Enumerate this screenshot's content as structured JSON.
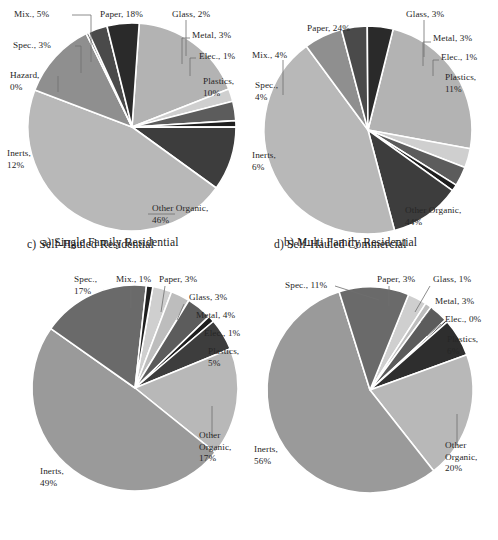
{
  "figure": {
    "background": "#ffffff",
    "panel_count": 4
  },
  "palette": {
    "paper": "#b3b3b3",
    "glass": "#cfcfcf",
    "metal": "#5c5c5c",
    "electronics": "#1f1f1f",
    "plastics": "#3d3d3d",
    "other_organic": "#b8b8b8",
    "inerts": "#8f8f8f",
    "hazardous": "#707070",
    "special": "#4a4a4a",
    "mixed": "#2a2a2a",
    "separator": "#ffffff",
    "text": "#262626",
    "leader_line": "#6f6f6f"
  },
  "panels": [
    {
      "id": "a",
      "caption": "a) Single Family Residential",
      "center": {
        "x": 132,
        "y": 127
      },
      "radius": 104,
      "start_angle_deg": -86,
      "slices": [
        {
          "key": "paper",
          "label": "Paper, 18%",
          "value": 18,
          "color": "#b3b3b3"
        },
        {
          "key": "glass",
          "label": "Glass, 2%",
          "value": 2,
          "color": "#cfcfcf"
        },
        {
          "key": "metal",
          "label": "Metal, 3%",
          "value": 3,
          "color": "#5c5c5c"
        },
        {
          "key": "electronics",
          "label": "Elec., 1%",
          "value": 1,
          "color": "#1f1f1f"
        },
        {
          "key": "plastics",
          "label": "Plastics, 10%",
          "value": 10,
          "color": "#3d3d3d"
        },
        {
          "key": "other_organic",
          "label": "Other Organic, 46%",
          "value": 46,
          "color": "#b8b8b8"
        },
        {
          "key": "inerts",
          "label": "Inerts, 12%",
          "value": 12,
          "color": "#8f8f8f"
        },
        {
          "key": "hazardous",
          "label": "Hazard, 0%",
          "value": 0.4,
          "color": "#707070"
        },
        {
          "key": "special",
          "label": "Spec., 3%",
          "value": 3,
          "color": "#4a4a4a"
        },
        {
          "key": "mixed",
          "label": "Mix., 5%",
          "value": 5,
          "color": "#2a2a2a"
        }
      ],
      "labels": [
        {
          "name": "label-mixed",
          "line1": "Mix., 5%",
          "line2": "",
          "x": 14,
          "y": 9,
          "align": "left"
        },
        {
          "name": "label-paper",
          "line1": "Paper, 18%",
          "line2": "",
          "x": 100,
          "y": 9,
          "align": "left"
        },
        {
          "name": "label-glass",
          "line1": "Glass, 2%",
          "line2": "",
          "x": 172,
          "y": 9,
          "align": "left"
        },
        {
          "name": "label-metal",
          "line1": "Metal, 3%",
          "line2": "",
          "x": 192,
          "y": 30,
          "align": "left"
        },
        {
          "name": "label-special",
          "line1": "Spec., 3%",
          "line2": "",
          "x": 13,
          "y": 40,
          "align": "left"
        },
        {
          "name": "label-electronics",
          "line1": "Elec., 1%",
          "line2": "",
          "x": 199,
          "y": 51,
          "align": "left"
        },
        {
          "name": "label-hazardous",
          "line1": "Hazard,",
          "line2": "0%",
          "x": 10,
          "y": 70,
          "align": "left"
        },
        {
          "name": "label-plastics",
          "line1": "Plastics,",
          "line2": "10%",
          "x": 203,
          "y": 76,
          "align": "left"
        },
        {
          "name": "label-inerts",
          "line1": "Inerts,",
          "line2": "12%",
          "x": 7,
          "y": 148,
          "align": "left"
        },
        {
          "name": "label-other-organic",
          "line1": "Other Organic,",
          "line2": "46%",
          "x": 152,
          "y": 203,
          "align": "left"
        }
      ],
      "leaders": [
        {
          "name": "leader-mixed",
          "points": "72,15 91,15 91,62"
        },
        {
          "name": "leader-special",
          "points": "75,46 81,46 81,73"
        },
        {
          "name": "leader-hazardous",
          "points": "58,76 58,92"
        },
        {
          "name": "leader-glass",
          "points": "186,20 186,56"
        },
        {
          "name": "leader-metal",
          "points": "190,38 182,38 182,64"
        },
        {
          "name": "leader-electronics",
          "points": "196,58 190,58 190,76"
        },
        {
          "name": "leader-other",
          "points": "148,214 175,214"
        }
      ]
    },
    {
      "id": "b",
      "caption": "b) Multi Family Residential",
      "center": {
        "x": 119,
        "y": 130
      },
      "radius": 104,
      "start_angle_deg": -76,
      "slices": [
        {
          "key": "paper",
          "label": "Paper, 24%",
          "value": 24,
          "color": "#b3b3b3"
        },
        {
          "key": "glass",
          "label": "Glass, 3%",
          "value": 3,
          "color": "#cfcfcf"
        },
        {
          "key": "metal",
          "label": "Metal, 3%",
          "value": 3,
          "color": "#5c5c5c"
        },
        {
          "key": "electronics",
          "label": "Elec., 1%",
          "value": 1,
          "color": "#1f1f1f"
        },
        {
          "key": "plastics",
          "label": "Plastics, 11%",
          "value": 11,
          "color": "#3d3d3d"
        },
        {
          "key": "other_organic",
          "label": "Other Organic, 44%",
          "value": 44,
          "color": "#b8b8b8"
        },
        {
          "key": "inerts",
          "label": "Inerts, 6%",
          "value": 6,
          "color": "#8f8f8f"
        },
        {
          "key": "special",
          "label": "Spec., 4%",
          "value": 4,
          "color": "#4a4a4a"
        },
        {
          "key": "mixed",
          "label": "Mix., 4%",
          "value": 4,
          "color": "#2a2a2a"
        }
      ],
      "labels": [
        {
          "name": "label-paper",
          "line1": "Paper, 24%",
          "line2": "",
          "x": 58,
          "y": 23,
          "align": "left"
        },
        {
          "name": "label-glass",
          "line1": "Glass, 3%",
          "line2": "",
          "x": 157,
          "y": 9,
          "align": "left"
        },
        {
          "name": "label-metal",
          "line1": "Metal, 3%",
          "line2": "",
          "x": 184,
          "y": 33,
          "align": "left"
        },
        {
          "name": "label-mixed",
          "line1": "Mix., 4%",
          "line2": "",
          "x": 3,
          "y": 50,
          "align": "left"
        },
        {
          "name": "label-electronics",
          "line1": "Elec., 1%",
          "line2": "",
          "x": 192,
          "y": 52,
          "align": "left"
        },
        {
          "name": "label-special",
          "line1": "Spec.,",
          "line2": "4%",
          "x": 6,
          "y": 80,
          "align": "left"
        },
        {
          "name": "label-plastics",
          "line1": "Plastics,",
          "line2": "11%",
          "x": 196,
          "y": 72,
          "align": "left"
        },
        {
          "name": "label-inerts",
          "line1": "Inerts,",
          "line2": "6%",
          "x": 3,
          "y": 150,
          "align": "left"
        },
        {
          "name": "label-other-organic",
          "line1": "Other Organic,",
          "line2": "44%",
          "x": 156,
          "y": 205,
          "align": "left"
        }
      ],
      "leaders": [
        {
          "name": "leader-glass",
          "points": "175,20 175,57"
        },
        {
          "name": "leader-metal",
          "points": "182,42 174,42 174,66"
        },
        {
          "name": "leader-electronics",
          "points": "190,60 184,60 184,76"
        },
        {
          "name": "leader-mixed",
          "points": "34,60 34,95"
        }
      ]
    },
    {
      "id": "c",
      "caption": "c) Self-Hauled Residential",
      "center": {
        "x": 135,
        "y": 122
      },
      "radius": 103,
      "start_angle_deg": -80,
      "slices": [
        {
          "key": "paper",
          "label": "Paper, 3%",
          "value": 3,
          "color": "#cfcfcf"
        },
        {
          "key": "glass",
          "label": "Glass, 3%",
          "value": 3,
          "color": "#bdbdbd"
        },
        {
          "key": "metal",
          "label": "Metal, 4%",
          "value": 4,
          "color": "#5c5c5c"
        },
        {
          "key": "electronics",
          "label": "Elec., 1%",
          "value": 1,
          "color": "#1f1f1f"
        },
        {
          "key": "plastics",
          "label": "Plastics, 5%",
          "value": 5,
          "color": "#3d3d3d"
        },
        {
          "key": "other_organic",
          "label": "Other Organic, 17%",
          "value": 17,
          "color": "#b8b8b8"
        },
        {
          "key": "inerts",
          "label": "Inerts, 49%",
          "value": 49,
          "color": "#9a9a9a"
        },
        {
          "key": "special",
          "label": "Spec., 17%",
          "value": 17,
          "color": "#6a6a6a"
        },
        {
          "key": "mixed",
          "label": "Mix., 1%",
          "value": 1,
          "color": "#1f1f1f"
        }
      ],
      "labels": [
        {
          "name": "label-special",
          "line1": "Spec.,",
          "line2": "17%",
          "x": 74,
          "y": 8,
          "align": "left"
        },
        {
          "name": "label-mixed",
          "line1": "Mix., 1%",
          "line2": "",
          "x": 116,
          "y": 8,
          "align": "left"
        },
        {
          "name": "label-paper",
          "line1": "Paper, 3%",
          "line2": "",
          "x": 159,
          "y": 8,
          "align": "left"
        },
        {
          "name": "label-glass",
          "line1": "Glass, 3%",
          "line2": "",
          "x": 189,
          "y": 26,
          "align": "left"
        },
        {
          "name": "label-metal",
          "line1": "Metal, 4%",
          "line2": "",
          "x": 196,
          "y": 44,
          "align": "left"
        },
        {
          "name": "label-electronics",
          "line1": "Elec., 1%",
          "line2": "",
          "x": 204,
          "y": 62,
          "align": "left"
        },
        {
          "name": "label-plastics",
          "line1": "Plastics,",
          "line2": "5%",
          "x": 208,
          "y": 80,
          "align": "left"
        },
        {
          "name": "label-other-organic",
          "line1": "Other",
          "line2": "Organic,",
          "line3": "17%",
          "x": 199,
          "y": 164,
          "align": "left"
        },
        {
          "name": "label-inerts",
          "line1": "Inerts,",
          "line2": "49%",
          "x": 40,
          "y": 200,
          "align": "left"
        }
      ],
      "leaders": [
        {
          "name": "leader-mixed",
          "points": "131,20 131,42"
        },
        {
          "name": "leader-paper",
          "points": "165,20 161,46"
        },
        {
          "name": "leader-glass",
          "points": "184,38 177,54"
        },
        {
          "name": "leader-other",
          "points": "212,140 212,170"
        }
      ]
    },
    {
      "id": "d",
      "caption": "d) Self-Hauled Commercial",
      "center": {
        "x": 121,
        "y": 124
      },
      "radius": 103,
      "start_angle_deg": -68,
      "slices": [
        {
          "key": "paper",
          "label": "Paper, 3%",
          "value": 3,
          "color": "#cfcfcf"
        },
        {
          "key": "glass",
          "label": "Glass, 1%",
          "value": 1,
          "color": "#bdbdbd"
        },
        {
          "key": "metal",
          "label": "Metal, 3%",
          "value": 3,
          "color": "#5c5c5c"
        },
        {
          "key": "electronics",
          "label": "Elec., 0%",
          "value": 0.4,
          "color": "#1f1f1f"
        },
        {
          "key": "plastics",
          "label": "Plastics, 6%",
          "value": 6,
          "color": "#2e2e2e"
        },
        {
          "key": "other_organic",
          "label": "Other Organic, 20%",
          "value": 20,
          "color": "#b8b8b8"
        },
        {
          "key": "inerts",
          "label": "Inerts, 56%",
          "value": 56,
          "color": "#9a9a9a"
        },
        {
          "key": "special",
          "label": "Spec., 11%",
          "value": 11,
          "color": "#6a6a6a"
        }
      ],
      "labels": [
        {
          "name": "label-special",
          "line1": "Spec., 11%",
          "line2": "",
          "x": 36,
          "y": 14,
          "align": "left"
        },
        {
          "name": "label-paper",
          "line1": "Paper, 3%",
          "line2": "",
          "x": 128,
          "y": 8,
          "align": "left"
        },
        {
          "name": "label-glass",
          "line1": "Glass, 1%",
          "line2": "",
          "x": 184,
          "y": 8,
          "align": "left"
        },
        {
          "name": "label-metal",
          "line1": "Metal, 3%",
          "line2": "",
          "x": 186,
          "y": 30,
          "align": "left"
        },
        {
          "name": "label-electronics",
          "line1": "Elec., 0%",
          "line2": "",
          "x": 196,
          "y": 48,
          "align": "left"
        },
        {
          "name": "label-plastics",
          "line1": "Plastics,",
          "line2": "6%",
          "x": 198,
          "y": 68,
          "align": "left"
        },
        {
          "name": "label-other-organic",
          "line1": "Other",
          "line2": "Organic,",
          "line3": "20%",
          "x": 196,
          "y": 174,
          "align": "left"
        },
        {
          "name": "label-inerts",
          "line1": "Inerts,",
          "line2": "56%",
          "x": 5,
          "y": 178,
          "align": "left"
        }
      ],
      "leaders": [
        {
          "name": "leader-special",
          "points": "86,20 130,34"
        },
        {
          "name": "leader-paper",
          "points": "140,20 140,40"
        },
        {
          "name": "leader-glass",
          "points": "181,20 166,46"
        },
        {
          "name": "leader-metal",
          "points": "183,42 172,56"
        },
        {
          "name": "leader-electronics",
          "points": "192,58 178,70"
        },
        {
          "name": "leader-other",
          "points": "208,148 208,180"
        }
      ]
    }
  ],
  "chart_data": {
    "type": "pie",
    "legend_position": "none",
    "unit": "percent",
    "categories": [
      "Paper",
      "Glass",
      "Metal",
      "Elec.",
      "Plastics",
      "Other Organic",
      "Inerts",
      "Hazard",
      "Spec.",
      "Mix."
    ],
    "charts": [
      {
        "panel": "a",
        "title": "a) Single Family Residential",
        "labels": [
          "Paper, 18%",
          "Glass, 2%",
          "Metal, 3%",
          "Elec., 1%",
          "Plastics, 10%",
          "Other Organic, 46%",
          "Inerts, 12%",
          "Hazard, 0%",
          "Spec., 3%",
          "Mix., 5%"
        ],
        "values": [
          18,
          2,
          3,
          1,
          10,
          46,
          12,
          0,
          3,
          5
        ]
      },
      {
        "panel": "b",
        "title": "b) Multi Family Residential",
        "labels": [
          "Paper, 24%",
          "Glass, 3%",
          "Metal, 3%",
          "Elec., 1%",
          "Plastics, 11%",
          "Other Organic, 44%",
          "Inerts, 6%",
          "Spec., 4%",
          "Mix., 4%"
        ],
        "values": [
          24,
          3,
          3,
          1,
          11,
          44,
          6,
          4,
          4
        ]
      },
      {
        "panel": "c",
        "title": "c) Self-Hauled Residential",
        "labels": [
          "Paper, 3%",
          "Glass, 3%",
          "Metal, 4%",
          "Elec., 1%",
          "Plastics, 5%",
          "Other Organic, 17%",
          "Inerts, 49%",
          "Spec., 17%",
          "Mix., 1%"
        ],
        "values": [
          3,
          3,
          4,
          1,
          5,
          17,
          49,
          17,
          1
        ]
      },
      {
        "panel": "d",
        "title": "d) Self-Hauled Commercial",
        "labels": [
          "Paper, 3%",
          "Glass, 1%",
          "Metal, 3%",
          "Elec., 0%",
          "Plastics, 6%",
          "Other Organic, 20%",
          "Inerts, 56%",
          "Spec., 11%"
        ],
        "values": [
          3,
          1,
          3,
          0,
          6,
          20,
          56,
          11
        ]
      }
    ]
  }
}
